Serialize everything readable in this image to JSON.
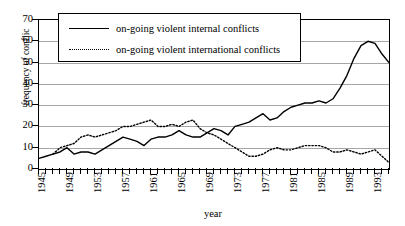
{
  "chart_data": {
    "type": "line",
    "title": "",
    "xlabel": "year",
    "ylabel": "frequency of conflic",
    "xlim": [
      1945,
      1995
    ],
    "ylim": [
      0,
      70
    ],
    "grid": true,
    "legend_position": "top-center",
    "y_ticks": [
      0,
      10,
      20,
      30,
      40,
      50,
      60,
      70
    ],
    "x_tick_labels": [
      "1945",
      "1949",
      "1953",
      "1957",
      "1961",
      "1965",
      "1969",
      "1973",
      "1977",
      "1981",
      "1985",
      "1989",
      "1993"
    ],
    "x_tick_values": [
      1945,
      1949,
      1953,
      1957,
      1961,
      1965,
      1969,
      1973,
      1977,
      1981,
      1985,
      1989,
      1993
    ],
    "x_minor_tick_step": 1,
    "x": [
      1945,
      1946,
      1947,
      1948,
      1949,
      1950,
      1951,
      1952,
      1953,
      1954,
      1955,
      1956,
      1957,
      1958,
      1959,
      1960,
      1961,
      1962,
      1963,
      1964,
      1965,
      1966,
      1967,
      1968,
      1969,
      1970,
      1971,
      1972,
      1973,
      1974,
      1975,
      1976,
      1977,
      1978,
      1979,
      1980,
      1981,
      1982,
      1983,
      1984,
      1985,
      1986,
      1987,
      1988,
      1989,
      1990,
      1991,
      1992,
      1993,
      1994,
      1995
    ],
    "series": [
      {
        "name": "on-going violent internal conflicts",
        "style": "solid",
        "color": "#000000",
        "values": [
          5,
          6,
          7,
          8,
          10,
          7,
          8,
          8,
          7,
          9,
          11,
          13,
          15,
          14,
          13,
          11,
          14,
          15,
          15,
          16,
          18,
          16,
          15,
          15,
          17,
          19,
          18,
          16,
          20,
          21,
          22,
          24,
          26,
          23,
          24,
          27,
          29,
          30,
          31,
          31,
          32,
          31,
          33,
          38,
          44,
          52,
          58,
          60,
          59,
          54,
          50
        ]
      },
      {
        "name": "on-going violent international conflicts",
        "style": "dotted",
        "color": "#000000",
        "values": [
          null,
          null,
          7,
          10,
          11,
          12,
          15,
          16,
          15,
          16,
          17,
          18,
          20,
          20,
          21,
          22,
          23,
          20,
          20,
          21,
          20,
          22,
          23,
          19,
          17,
          16,
          14,
          12,
          10,
          8,
          6,
          6,
          7,
          9,
          10,
          9,
          9,
          10,
          11,
          11,
          11,
          10,
          8,
          8,
          9,
          8,
          7,
          8,
          9,
          6,
          3
        ]
      }
    ]
  },
  "legend": {
    "entries": [
      {
        "label": "on-going violent internal conflicts",
        "style": "solid"
      },
      {
        "label": "on-going violent international conflicts",
        "style": "dotted"
      }
    ]
  },
  "axes": {
    "y_title": "frequency of conflic",
    "x_title": "year"
  }
}
